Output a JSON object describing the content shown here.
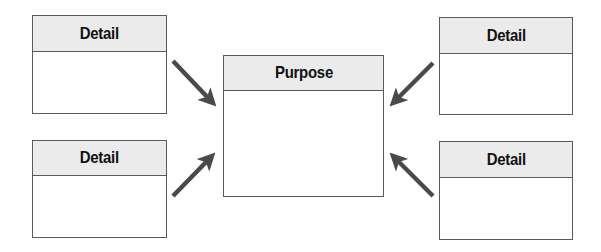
{
  "diagram": {
    "center": {
      "label": "Purpose"
    },
    "details": [
      {
        "id": "top-left",
        "label": "Detail"
      },
      {
        "id": "top-right",
        "label": "Detail"
      },
      {
        "id": "bottom-left",
        "label": "Detail"
      },
      {
        "id": "bottom-right",
        "label": "Detail"
      }
    ],
    "arrows": [
      {
        "from": "top-left",
        "to": "center"
      },
      {
        "from": "top-right",
        "to": "center"
      },
      {
        "from": "bottom-left",
        "to": "center"
      },
      {
        "from": "bottom-right",
        "to": "center"
      }
    ],
    "colors": {
      "header_fill": "#ebebeb",
      "border": "#5a5a5a",
      "arrow": "#4a4a4a",
      "text": "#111111"
    }
  }
}
